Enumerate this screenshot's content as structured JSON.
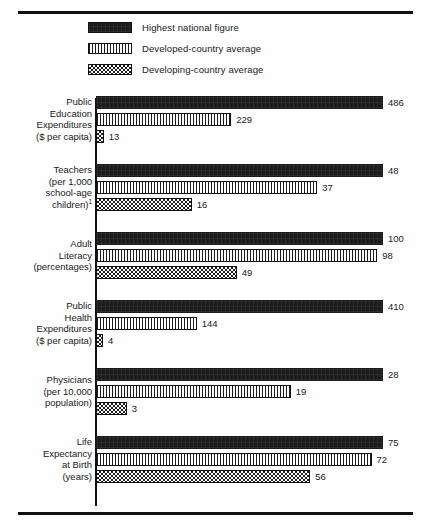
{
  "legend": {
    "items": [
      {
        "label": "Highest national figure",
        "pattern": "solid",
        "swatch_name": "legend-swatch-highest"
      },
      {
        "label": "Developed-country average",
        "pattern": "vstripe",
        "swatch_name": "legend-swatch-developed"
      },
      {
        "label": "Developing-country average",
        "pattern": "check",
        "swatch_name": "legend-swatch-developing"
      }
    ]
  },
  "colors": {
    "ink": "#1c1c1c",
    "paper": "#fefefe",
    "rule": "#111111"
  },
  "chart_data": {
    "type": "bar",
    "orientation": "horizontal",
    "title": "",
    "xlabel": "",
    "ylabel": "",
    "grid": false,
    "legend_position": "top",
    "scaling": "per-group-normalized",
    "note": "Each category group is scaled independently; the largest value in a group spans the full plot width.",
    "series": [
      {
        "name": "Highest national figure",
        "values": [
          486,
          48,
          100,
          410,
          28,
          75
        ]
      },
      {
        "name": "Developed-country average",
        "values": [
          229,
          37,
          98,
          144,
          19,
          72
        ]
      },
      {
        "name": "Developing-country average",
        "values": [
          13,
          16,
          49,
          4,
          3,
          56
        ]
      }
    ],
    "categories": [
      "Public Education Expenditures ($ per capita)",
      "Teachers (per 1,000 school-age children)",
      "Adult Literacy (percentages)",
      "Public Health Expenditures ($ per capita)",
      "Physicians (per 10,000 population)",
      "Life Expectancy at Birth (years)"
    ],
    "groups": [
      {
        "label_lines": [
          "Public",
          "Education",
          "Expenditures",
          "($ per capita)"
        ],
        "footnote_marker": "",
        "max": 486,
        "bars": [
          {
            "value": 486,
            "display": "486",
            "pattern": "solid"
          },
          {
            "value": 229,
            "display": "229",
            "pattern": "vstripe"
          },
          {
            "value": 13,
            "display": "13",
            "pattern": "check"
          }
        ]
      },
      {
        "label_lines": [
          "Teachers",
          "(per 1,000",
          "school-age",
          "children)"
        ],
        "footnote_marker": "1",
        "max": 48,
        "bars": [
          {
            "value": 48,
            "display": "48",
            "pattern": "solid"
          },
          {
            "value": 37,
            "display": "37",
            "pattern": "vstripe"
          },
          {
            "value": 16,
            "display": "16",
            "pattern": "check"
          }
        ]
      },
      {
        "label_lines": [
          "Adult",
          "Literacy",
          "(percentages)"
        ],
        "footnote_marker": "",
        "max": 100,
        "bars": [
          {
            "value": 100,
            "display": "100",
            "pattern": "solid"
          },
          {
            "value": 98,
            "display": "98",
            "pattern": "vstripe"
          },
          {
            "value": 49,
            "display": "49",
            "pattern": "check"
          }
        ]
      },
      {
        "label_lines": [
          "Public",
          "Health",
          "Expenditures",
          "($ per capita)"
        ],
        "footnote_marker": "",
        "max": 410,
        "bars": [
          {
            "value": 410,
            "display": "410",
            "pattern": "solid"
          },
          {
            "value": 144,
            "display": "144",
            "pattern": "vstripe"
          },
          {
            "value": 4,
            "display": "4",
            "pattern": "check"
          }
        ]
      },
      {
        "label_lines": [
          "Physicians",
          "(per 10,000",
          "population)"
        ],
        "footnote_marker": "",
        "max": 28,
        "bars": [
          {
            "value": 28,
            "display": "28",
            "pattern": "solid"
          },
          {
            "value": 19,
            "display": "19",
            "pattern": "vstripe"
          },
          {
            "value": 3,
            "display": "3",
            "pattern": "check"
          }
        ]
      },
      {
        "label_lines": [
          "Life",
          "Expectancy",
          "at Birth",
          "(years)"
        ],
        "footnote_marker": "",
        "max": 75,
        "bars": [
          {
            "value": 75,
            "display": "75",
            "pattern": "solid"
          },
          {
            "value": 72,
            "display": "72",
            "pattern": "vstripe"
          },
          {
            "value": 56,
            "display": "56",
            "pattern": "check"
          }
        ]
      }
    ]
  }
}
